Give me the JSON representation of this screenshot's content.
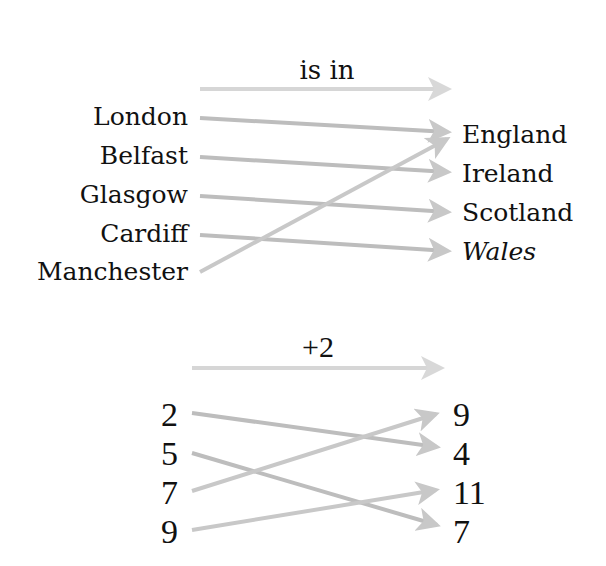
{
  "diagrams": [
    {
      "relation": "is in",
      "left": [
        "London",
        "Belfast",
        "Glasgow",
        "Cardiff",
        "Manchester"
      ],
      "right": [
        "England",
        "Ireland",
        "Scotland",
        "Wales"
      ],
      "mappings": [
        {
          "from": "London",
          "to": "England"
        },
        {
          "from": "Belfast",
          "to": "Ireland"
        },
        {
          "from": "Glasgow",
          "to": "Scotland"
        },
        {
          "from": "Cardiff",
          "to": "Wales"
        },
        {
          "from": "Manchester",
          "to": "England"
        }
      ]
    },
    {
      "relation": "+2",
      "left": [
        "2",
        "5",
        "7",
        "9"
      ],
      "right": [
        "9",
        "4",
        "11",
        "7"
      ],
      "mappings": [
        {
          "from": "2",
          "to": "4"
        },
        {
          "from": "5",
          "to": "7"
        },
        {
          "from": "7",
          "to": "9"
        },
        {
          "from": "9",
          "to": "11"
        }
      ]
    }
  ],
  "colors": {
    "arrow": "#c4c4c4",
    "arrow_dark": "#8a8a8a",
    "relation_arrow": "#d4d4d4",
    "text": "#111111"
  }
}
